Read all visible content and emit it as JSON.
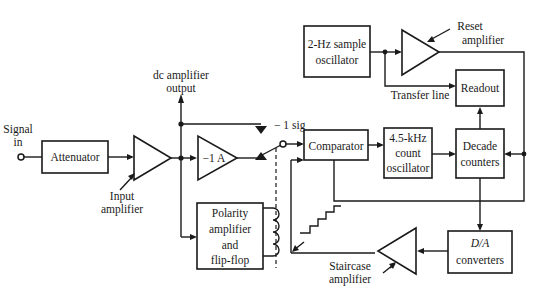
{
  "diagram": {
    "type": "block-diagram",
    "colors": {
      "line": "#1a1a1a",
      "background": "#ffffff"
    },
    "input": {
      "label_line1": "Signal",
      "label_line2": "in"
    },
    "blocks": {
      "attenuator": {
        "label": "Attenuator"
      },
      "polarity": {
        "line1": "Polarity",
        "line2": "amplifier",
        "line3": "and",
        "line4": "flip-flop"
      },
      "comparator": {
        "label": "Comparator"
      },
      "count_osc": {
        "line1": "4.5-kHz",
        "line2": "count",
        "line3": "oscillator"
      },
      "decade": {
        "line1": "Decade",
        "line2": "counters"
      },
      "sample_osc": {
        "line1": "2-Hz sample",
        "line2": "oscillator"
      },
      "readout": {
        "label": "Readout"
      },
      "da": {
        "line1": "D/A",
        "line2": "converters"
      }
    },
    "amplifiers": {
      "input_amp": {
        "line1": "Input",
        "line2": "amplifier"
      },
      "inverter": {
        "label": "−1 A"
      },
      "reset_amp": {
        "line1": "Reset",
        "line2": "amplifier"
      },
      "staircase_amp": {
        "line1": "Staircase",
        "line2": "amplifier"
      }
    },
    "labels": {
      "dc_output_line1": "dc amplifier",
      "dc_output_line2": "output",
      "minus_sig": "− 1 sig",
      "transfer_line": "Transfer line"
    }
  }
}
